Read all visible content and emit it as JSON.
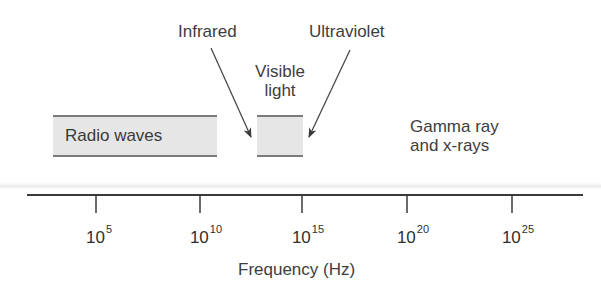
{
  "diagram": {
    "regions": [
      {
        "id": "radio",
        "label": "Radio waves",
        "x_start_exp": 3,
        "x_end_exp": 10.5
      },
      {
        "id": "visible",
        "label_line1": "Visible",
        "label_line2": "light",
        "x_start_exp": 14.3,
        "x_end_exp": 15
      }
    ],
    "callouts": {
      "infrared": "Infrared",
      "ultraviolet": "Ultraviolet",
      "gamma_line1": "Gamma ray",
      "gamma_line2": "and x-rays"
    },
    "axis": {
      "label": "Frequency (Hz)",
      "scale": "log10",
      "ticks": [
        {
          "base": "10",
          "exp": "5"
        },
        {
          "base": "10",
          "exp": "10"
        },
        {
          "base": "10",
          "exp": "15"
        },
        {
          "base": "10",
          "exp": "20"
        },
        {
          "base": "10",
          "exp": "25"
        }
      ]
    },
    "colors": {
      "band_fill": "#e6e6e6",
      "band_edge": "#7a7a7a",
      "line": "#3a3a3a",
      "text": "#3d3d3d"
    }
  }
}
